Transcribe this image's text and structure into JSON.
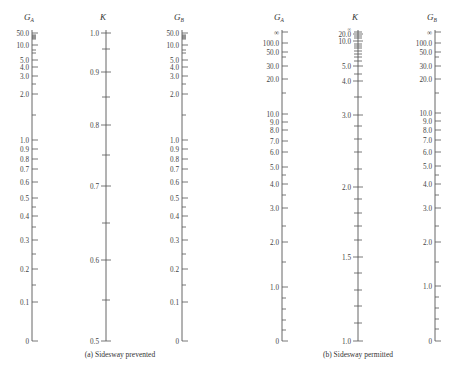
{
  "chart_data": [
    {
      "type": "nomograph",
      "caption": "(a)  Sidesway prevented",
      "axes": [
        {
          "name": "G_A",
          "title": "G",
          "subscript": "A",
          "x": 32,
          "label_side": "left",
          "ticks": [
            {
              "v": "50.0",
              "y": 33
            },
            {
              "v": "10.0",
              "y": 45
            },
            {
              "v": "5.0",
              "y": 60
            },
            {
              "v": "4.0",
              "y": 67
            },
            {
              "v": "3.0",
              "y": 76
            },
            {
              "v": "2.0",
              "y": 94
            },
            {
              "v": "1.0",
              "y": 140
            },
            {
              "v": "0.9",
              "y": 149
            },
            {
              "v": "0.8",
              "y": 159
            },
            {
              "v": "0.7",
              "y": 169
            },
            {
              "v": "0.6",
              "y": 182
            },
            {
              "v": "0.5",
              "y": 198
            },
            {
              "v": "0.4",
              "y": 216
            },
            {
              "v": "0.3",
              "y": 240
            },
            {
              "v": "0.2",
              "y": 269
            },
            {
              "v": "0.1",
              "y": 302
            },
            {
              "v": "0",
              "y": 341
            }
          ],
          "minor": [
            35,
            36,
            37,
            38,
            39,
            50,
            53,
            84,
            115,
            207,
            227,
            254,
            285
          ]
        },
        {
          "name": "K",
          "title": "K",
          "subscript": "",
          "x": 106,
          "label_side": "left",
          "ticks": [
            {
              "v": "1.0",
              "y": 33
            },
            {
              "v": "0.9",
              "y": 72
            },
            {
              "v": "0.8",
              "y": 125
            },
            {
              "v": "0.7",
              "y": 186
            },
            {
              "v": "0.6",
              "y": 260
            },
            {
              "v": "0.5",
              "y": 341
            }
          ],
          "minor": [
            49,
            97,
            155,
            223,
            300
          ]
        },
        {
          "name": "G_B",
          "title": "G",
          "subscript": "B",
          "x": 182,
          "label_side": "left",
          "ticks": [
            {
              "v": "50.0",
              "y": 33
            },
            {
              "v": "10.0",
              "y": 45
            },
            {
              "v": "5.0",
              "y": 60
            },
            {
              "v": "4.0",
              "y": 67
            },
            {
              "v": "3.0",
              "y": 76
            },
            {
              "v": "2.0",
              "y": 94
            },
            {
              "v": "1.0",
              "y": 140
            },
            {
              "v": "0.9",
              "y": 149
            },
            {
              "v": "0.8",
              "y": 159
            },
            {
              "v": "0.7",
              "y": 169
            },
            {
              "v": "0.6",
              "y": 182
            },
            {
              "v": "0.5",
              "y": 198
            },
            {
              "v": "0.4",
              "y": 216
            },
            {
              "v": "0.3",
              "y": 240
            },
            {
              "v": "0.2",
              "y": 269
            },
            {
              "v": "0.1",
              "y": 302
            },
            {
              "v": "0",
              "y": 341
            }
          ],
          "minor": [
            35,
            36,
            37,
            38,
            39,
            50,
            53,
            84,
            115,
            207,
            227,
            254,
            285
          ]
        }
      ]
    },
    {
      "type": "nomograph",
      "caption": "(b)  Sidesway permitted",
      "axes": [
        {
          "name": "G_A",
          "title": "G",
          "subscript": "A",
          "x": 282,
          "label_side": "left",
          "ticks": [
            {
              "v": "∞",
              "y": 32
            },
            {
              "v": "100.0",
              "y": 43
            },
            {
              "v": "50.0",
              "y": 52
            },
            {
              "v": "30.0",
              "y": 66
            },
            {
              "v": "20.0",
              "y": 79
            },
            {
              "v": "10.0",
              "y": 114
            },
            {
              "v": "9.0",
              "y": 122
            },
            {
              "v": "8.0",
              "y": 130
            },
            {
              "v": "7.0",
              "y": 141
            },
            {
              "v": "6.0",
              "y": 152
            },
            {
              "v": "5.0",
              "y": 167
            },
            {
              "v": "4.0",
              "y": 184
            },
            {
              "v": "3.0",
              "y": 208
            },
            {
              "v": "2.0",
              "y": 242
            },
            {
              "v": "1.0",
              "y": 287
            },
            {
              "v": "0",
              "y": 341
            }
          ],
          "minor": [
            57,
            93,
            175,
            195,
            226,
            262,
            298,
            309,
            320,
            330
          ]
        },
        {
          "name": "K",
          "title": "K",
          "subscript": "",
          "x": 358,
          "label_side": "left",
          "ticks": [
            {
              "v": "∞",
              "y": 28,
              "small": true
            },
            {
              "v": "20.0",
              "y": 34
            },
            {
              "v": "10.0",
              "y": 41
            },
            {
              "v": "5.0",
              "y": 66
            },
            {
              "v": "4.0",
              "y": 81
            },
            {
              "v": "3.0",
              "y": 115
            },
            {
              "v": "2.0",
              "y": 187
            },
            {
              "v": "1.5",
              "y": 257
            },
            {
              "v": "1.0",
              "y": 341
            }
          ],
          "minor": [
            32,
            36,
            38,
            44,
            46,
            48,
            51,
            54,
            57,
            61,
            74,
            97,
            126,
            139,
            152,
            169,
            199,
            213,
            226,
            240,
            273,
            290,
            306,
            323
          ]
        },
        {
          "name": "G_B",
          "title": "G",
          "subscript": "B",
          "x": 435,
          "label_side": "left",
          "ticks": [
            {
              "v": "∞",
              "y": 32
            },
            {
              "v": "100.0",
              "y": 43
            },
            {
              "v": "50.0",
              "y": 52
            },
            {
              "v": "30.0",
              "y": 66
            },
            {
              "v": "20.0",
              "y": 79
            },
            {
              "v": "10.0",
              "y": 113
            },
            {
              "v": "9.0",
              "y": 121
            },
            {
              "v": "8.0",
              "y": 130
            },
            {
              "v": "7.0",
              "y": 140
            },
            {
              "v": "6.0",
              "y": 152
            },
            {
              "v": "5.0",
              "y": 166
            },
            {
              "v": "4.0",
              "y": 184
            },
            {
              "v": "3.0",
              "y": 208
            },
            {
              "v": "2.0",
              "y": 242
            },
            {
              "v": "1.0",
              "y": 286
            },
            {
              "v": "0",
              "y": 341
            }
          ],
          "minor": [
            57,
            93,
            175,
            195,
            226,
            262,
            297,
            308,
            319,
            329
          ]
        }
      ]
    }
  ],
  "captions": {
    "a": "(a)  Sidesway prevented",
    "b": "(b)  Sidesway permitted"
  },
  "layout": {
    "title_y": 20,
    "axis_top": 30,
    "axis_bottom": 341,
    "caption_y": 357,
    "caption_a_x": 120,
    "caption_b_x": 358
  }
}
